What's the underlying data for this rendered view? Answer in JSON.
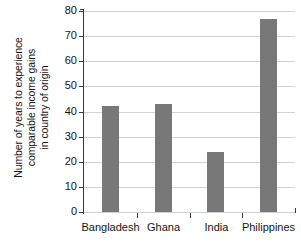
{
  "chart_data": {
    "type": "bar",
    "title": "",
    "xlabel": "",
    "ylabel": "Number of years to experience comparable income gains in country of origin",
    "ylabel_lines": [
      "Number of years to experience",
      "comparable income gains",
      "in country of origin"
    ],
    "categories": [
      "Bangladesh",
      "Ghana",
      "India",
      "Philippines"
    ],
    "values": [
      42,
      43,
      24,
      77
    ],
    "ylim": [
      0,
      80
    ],
    "yticks": [
      0,
      10,
      20,
      30,
      40,
      50,
      60,
      70,
      80
    ],
    "ytick_labels": [
      "0",
      "10",
      "20",
      "30",
      "40",
      "50",
      "60",
      "70",
      "80"
    ],
    "grid": true,
    "grid_axis": "y",
    "legend": false,
    "legend_position": "none",
    "bar_color": "#787878",
    "grid_color": "#d2d2d2",
    "axis_color": "#3a3a3a",
    "background_color": "#ffffff",
    "text_color": "#141414"
  }
}
